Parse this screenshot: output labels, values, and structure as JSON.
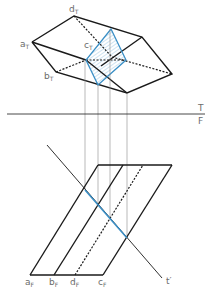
{
  "diagram": {
    "type": "orthographic-projection",
    "colors": {
      "line": "#1a1a1a",
      "projector": "#8a8a8a",
      "accent": "#3a8fc6",
      "label": "#6b6b6b"
    },
    "fold_line": {
      "upper": "T",
      "lower": "F"
    },
    "top_view_labels": {
      "a": {
        "main": "a",
        "sub": "T"
      },
      "b": {
        "main": "b",
        "sub": "T"
      },
      "c": {
        "main": "c",
        "sub": "T"
      },
      "d": {
        "main": "d",
        "sub": "T"
      }
    },
    "front_view_labels": {
      "a": {
        "main": "a",
        "sub": "F"
      },
      "b": {
        "main": "b",
        "sub": "F"
      },
      "d": {
        "main": "d",
        "sub": "F"
      },
      "c": {
        "main": "c",
        "sub": "F"
      }
    },
    "cutting_plane_label": "t′"
  }
}
